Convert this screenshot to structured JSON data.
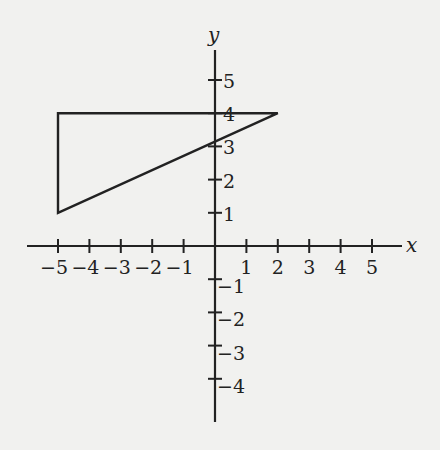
{
  "chart_data": {
    "type": "diagram",
    "title": "",
    "xlabel": "x",
    "ylabel": "y",
    "x_ticks": [
      -5,
      -4,
      -3,
      -2,
      -1,
      1,
      2,
      3,
      4,
      5
    ],
    "y_ticks": [
      5,
      4,
      3,
      2,
      1,
      -1,
      -2,
      -3,
      -4
    ],
    "x_tick_labels": [
      "−5",
      "−4",
      "−3",
      "−2",
      "−1",
      "1",
      "2",
      "3",
      "4",
      "5"
    ],
    "y_tick_labels": [
      "5",
      "4",
      "3",
      "2",
      "1",
      "−1",
      "−2",
      "−3",
      "−4"
    ],
    "xlim": [
      -6,
      6
    ],
    "ylim": [
      -5,
      6
    ],
    "grid": false,
    "shapes": [
      {
        "type": "triangle",
        "vertices": [
          [
            -5,
            4
          ],
          [
            2,
            4
          ],
          [
            -5,
            1
          ]
        ]
      }
    ]
  },
  "colors": {
    "background": "#f1f1ef",
    "ink": "#222222"
  }
}
